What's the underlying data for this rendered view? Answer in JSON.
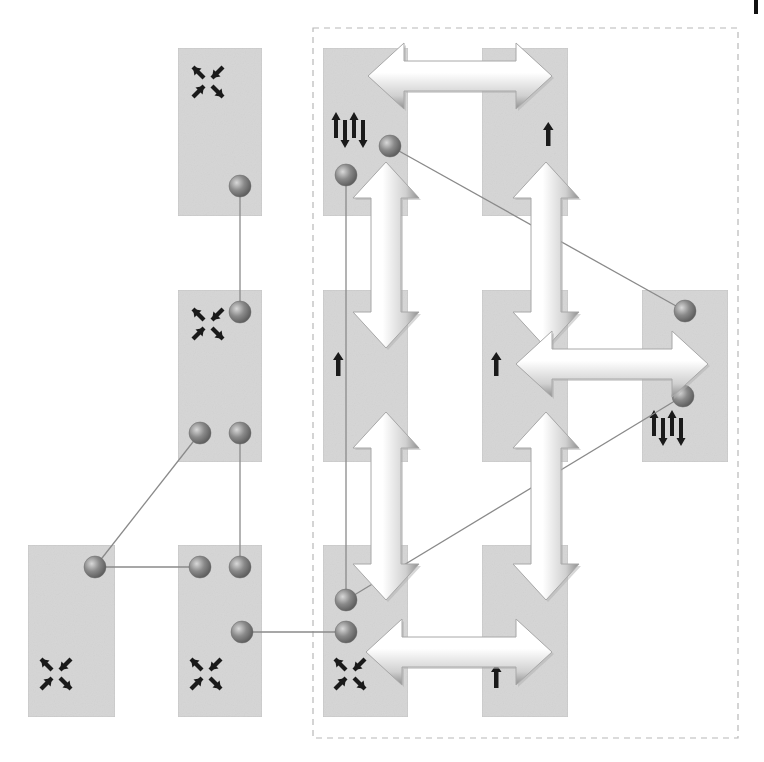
{
  "diagram": {
    "title": "",
    "colors": {
      "node_fill": "#d6d6d6",
      "node_border": "#c4c4c4",
      "port_fill": "#8c8c8c",
      "link_stroke": "#8a8a8a",
      "group_border": "#b8b8b8",
      "glyph": "#1a1a1a",
      "arrow_light": "#ffffff",
      "arrow_shadow": "#9a9a9a"
    },
    "group": {
      "name": "dashed-region",
      "style": "dashed"
    },
    "nodes": [
      {
        "id": "n-c2-r1",
        "col": 2,
        "row": 1,
        "glyph": "compress-x-icon",
        "in_group": false
      },
      {
        "id": "n-c3-r1",
        "col": 3,
        "row": 1,
        "glyph": "up-down-spin-icon",
        "in_group": true
      },
      {
        "id": "n-c4-r1",
        "col": 4,
        "row": 1,
        "glyph": "up-arrow-icon",
        "in_group": true
      },
      {
        "id": "n-c2-r2",
        "col": 2,
        "row": 2,
        "glyph": "compress-x-icon",
        "in_group": false
      },
      {
        "id": "n-c3-r2",
        "col": 3,
        "row": 2,
        "glyph": "up-arrow-icon",
        "in_group": true
      },
      {
        "id": "n-c4-r2",
        "col": 4,
        "row": 2,
        "glyph": "up-arrow-icon",
        "in_group": true
      },
      {
        "id": "n-c5-r2",
        "col": 5,
        "row": 2,
        "glyph": "up-down-spin-icon",
        "in_group": true
      },
      {
        "id": "n-c1-r3",
        "col": 1,
        "row": 3,
        "glyph": "compress-x-icon",
        "in_group": false
      },
      {
        "id": "n-c2-r3",
        "col": 2,
        "row": 3,
        "glyph": "compress-x-icon",
        "in_group": false
      },
      {
        "id": "n-c3-r3",
        "col": 3,
        "row": 3,
        "glyph": "compress-x-icon",
        "in_group": true
      },
      {
        "id": "n-c4-r3",
        "col": 4,
        "row": 3,
        "glyph": "up-arrow-icon",
        "in_group": true
      }
    ],
    "ports": [
      {
        "id": "p1",
        "node": "n-c2-r1"
      },
      {
        "id": "p2",
        "node": "n-c2-r2"
      },
      {
        "id": "p3",
        "node": "n-c2-r2"
      },
      {
        "id": "p4",
        "node": "n-c2-r2"
      },
      {
        "id": "p5",
        "node": "n-c1-r3"
      },
      {
        "id": "p6",
        "node": "n-c2-r3"
      },
      {
        "id": "p7",
        "node": "n-c2-r3"
      },
      {
        "id": "p8",
        "node": "n-c2-r3"
      },
      {
        "id": "p9",
        "node": "n-c3-r1"
      },
      {
        "id": "p10",
        "node": "n-c3-r1"
      },
      {
        "id": "p11",
        "node": "n-c3-r3"
      },
      {
        "id": "p12",
        "node": "n-c3-r3"
      },
      {
        "id": "p13",
        "node": "n-c5-r2"
      },
      {
        "id": "p14",
        "node": "n-c5-r2"
      }
    ],
    "links": [
      {
        "from": "p1",
        "to": "p2"
      },
      {
        "from": "p4",
        "to": "p7"
      },
      {
        "from": "p3",
        "to": "p5"
      },
      {
        "from": "p5",
        "to": "p6"
      },
      {
        "from": "p8",
        "to": "p12"
      },
      {
        "from": "p9",
        "to": "p11"
      },
      {
        "from": "p10",
        "to": "p13"
      },
      {
        "from": "p14",
        "to": "p11"
      }
    ],
    "exchange_arrows": [
      {
        "id": "a-top",
        "orientation": "horizontal",
        "between": [
          "n-c3-r1",
          "n-c4-r1"
        ]
      },
      {
        "id": "a-c3-upper",
        "orientation": "vertical",
        "between": [
          "n-c3-r1",
          "n-c3-r2"
        ]
      },
      {
        "id": "a-c4-upper",
        "orientation": "vertical",
        "between": [
          "n-c4-r1",
          "n-c4-r2"
        ]
      },
      {
        "id": "a-mid",
        "orientation": "horizontal",
        "between": [
          "n-c4-r2",
          "n-c5-r2"
        ]
      },
      {
        "id": "a-c3-lower",
        "orientation": "vertical",
        "between": [
          "n-c3-r2",
          "n-c3-r3"
        ]
      },
      {
        "id": "a-c4-lower",
        "orientation": "vertical",
        "between": [
          "n-c4-r2",
          "n-c4-r3"
        ]
      },
      {
        "id": "a-bottom",
        "orientation": "horizontal",
        "between": [
          "n-c3-r3",
          "n-c4-r3"
        ]
      }
    ]
  }
}
